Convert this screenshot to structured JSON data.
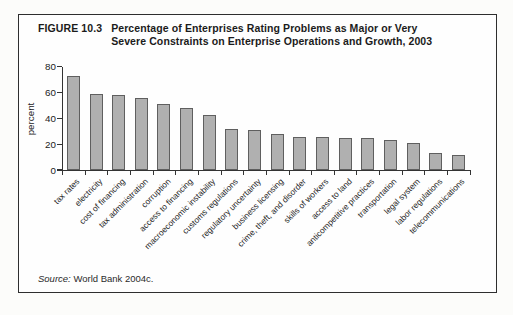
{
  "figure": {
    "label": "FIGURE 10.3",
    "title_lines": [
      "Percentage of Enterprises Rating Problems as Major or Very",
      "Severe Constraints on Enterprise Operations and Growth, 2003"
    ],
    "source_label": "Source:",
    "source_text": "World Bank 2004c."
  },
  "chart_data": {
    "type": "bar",
    "title": "Percentage of Enterprises Rating Problems as Major or Very Severe Constraints on Enterprise Operations and Growth, 2003",
    "xlabel": "",
    "ylabel": "percent",
    "ylim": [
      0,
      80
    ],
    "yticks": [
      0,
      20,
      40,
      60,
      80
    ],
    "grid": false,
    "legend": "none",
    "bar_color": "#b0b0b0",
    "bar_border_color": "#5f5f5f",
    "categories": [
      "tax rates",
      "electricity",
      "cost of financing",
      "tax administration",
      "corruption",
      "access to financing",
      "macroeconomic instability",
      "customs regulations",
      "regulatory uncertainty",
      "business licensing",
      "crime, theft, and disorder",
      "skills of workers",
      "access to land",
      "anticompetitive practices",
      "transportation",
      "legal system",
      "labor regulations",
      "telecommunications"
    ],
    "values": [
      73,
      59,
      58,
      56,
      51,
      48,
      43,
      32,
      31,
      28,
      26,
      26,
      25,
      25,
      23,
      21,
      13,
      12
    ]
  }
}
